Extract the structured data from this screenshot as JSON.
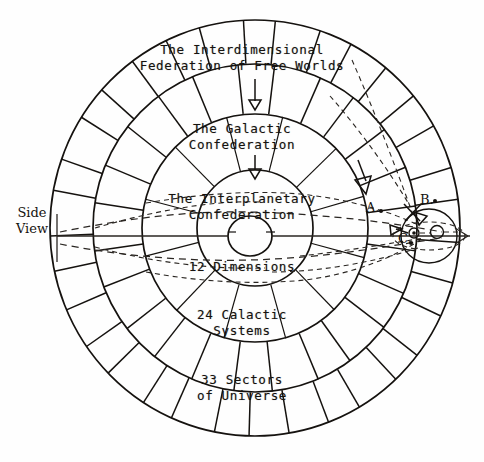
{
  "diagram": {
    "title_labels": {
      "outer_ring": {
        "line1": "The Interdimensional",
        "line2": "Federation of Free Worlds"
      },
      "second_ring": {
        "line1": "The Galactic",
        "line2": "Confederation"
      },
      "third_ring": {
        "line1": "The Interplanetary",
        "line2": "Confederation"
      },
      "core": "12 Dimensions",
      "mid_ring_count": {
        "line1": "24 Calactic",
        "line2": "Systems"
      },
      "outer_ring_count": {
        "line1": "33 Sectors",
        "line2": "of Universe"
      }
    },
    "side_view_label": {
      "line1": "Side",
      "line2": "View"
    },
    "detail_markers": [
      {
        "id": "marker-a",
        "label": "A."
      },
      {
        "id": "marker-b",
        "label": "B."
      },
      {
        "id": "marker-c",
        "label": "C."
      }
    ],
    "structure": {
      "rings": 4,
      "outer_sector_count": 33,
      "middle_sector_count": 24,
      "inner_sector_count": 12,
      "center": {
        "x": 255,
        "y": 228
      },
      "radii": [
        205,
        160,
        112,
        58,
        23
      ]
    },
    "colors": {
      "ink": "#15120f",
      "paper": "#fefefe",
      "dash": "#2a2622"
    }
  }
}
